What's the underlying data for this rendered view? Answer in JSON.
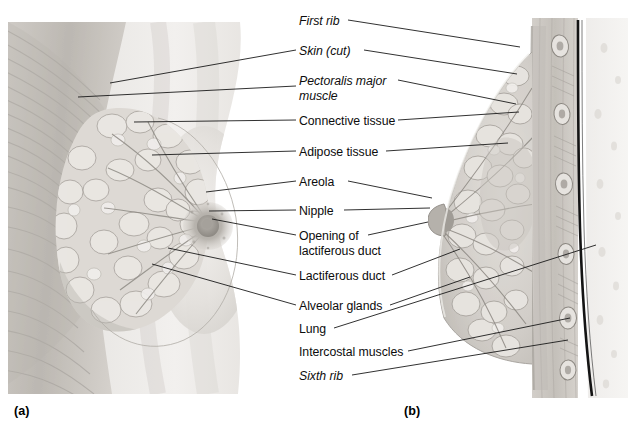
{
  "figure": {
    "panels": [
      {
        "key": "a",
        "caption": "(a)",
        "view": "anterior-dissection"
      },
      {
        "key": "b",
        "caption": "(b)",
        "view": "sagittal-section"
      }
    ],
    "labels": [
      {
        "id": "first-rib",
        "text": "First rib",
        "italic": true,
        "x": 299,
        "y": 14,
        "lines": 1
      },
      {
        "id": "skin-cut",
        "text": "Skin (cut)",
        "italic": true,
        "x": 299,
        "y": 44,
        "lines": 1
      },
      {
        "id": "pectoralis-major",
        "text": "Pectoralis major",
        "italic": true,
        "x": 299,
        "y": 74,
        "lines": 2,
        "text2": "muscle"
      },
      {
        "id": "connective-tissue",
        "text": "Connective tissue",
        "italic": false,
        "x": 299,
        "y": 114,
        "lines": 1
      },
      {
        "id": "adipose-tissue",
        "text": "Adipose tissue",
        "italic": false,
        "x": 299,
        "y": 145,
        "lines": 1
      },
      {
        "id": "areola",
        "text": "Areola",
        "italic": false,
        "x": 299,
        "y": 175,
        "lines": 1
      },
      {
        "id": "nipple",
        "text": "Nipple",
        "italic": false,
        "x": 299,
        "y": 204,
        "lines": 1
      },
      {
        "id": "opening-lactiferous-duct",
        "text": "Opening of",
        "italic": false,
        "x": 299,
        "y": 229,
        "lines": 2,
        "text2": "lactiferous duct"
      },
      {
        "id": "lactiferous-duct",
        "text": "Lactiferous duct",
        "italic": false,
        "x": 299,
        "y": 269,
        "lines": 1
      },
      {
        "id": "alveolar-glands",
        "text": "Alveolar glands",
        "italic": false,
        "x": 299,
        "y": 299,
        "lines": 1
      },
      {
        "id": "lung",
        "text": "Lung",
        "italic": false,
        "x": 299,
        "y": 322,
        "lines": 1
      },
      {
        "id": "intercostal-muscles",
        "text": "Intercostal muscles",
        "italic": false,
        "x": 299,
        "y": 345,
        "lines": 1
      },
      {
        "id": "sixth-rib",
        "text": "Sixth rib",
        "italic": true,
        "x": 299,
        "y": 369,
        "lines": 1
      }
    ],
    "caption_a": {
      "text": "(a)",
      "x": 14,
      "y": 404
    },
    "caption_b": {
      "text": "(b)",
      "x": 404,
      "y": 404
    },
    "colors": {
      "background": "#ffffff",
      "leader_line": "#1a1a1a",
      "label_text": "#0d0d0d",
      "tissue_light": "#e8e6e3",
      "tissue_mid": "#c9c6c2",
      "tissue_dark": "#9a9691",
      "muscle_shade": "#b5b1ab",
      "pleura_line": "#141414",
      "lung_field": "#f1efed"
    }
  }
}
